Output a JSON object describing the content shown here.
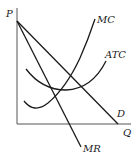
{
  "diagram": {
    "type": "economics-monopoly-cost-revenue",
    "axes": {
      "y_label": "P",
      "x_label": "Q"
    },
    "curves": {
      "mc": {
        "label": "MC"
      },
      "atc": {
        "label": "ATC"
      },
      "demand": {
        "label": "D"
      },
      "mr": {
        "label": "MR"
      }
    },
    "colors": {
      "line": "#1a1a1a",
      "axis": "#555555",
      "background": "#ffffff"
    }
  }
}
